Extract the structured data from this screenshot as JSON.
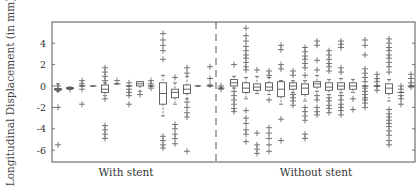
{
  "chart_data": {
    "type": "box",
    "title": "",
    "xlabel": "",
    "ylabel": "Longitudinal Displacement (in mm)",
    "ylim": [
      -7.1,
      6
    ],
    "yticks": [
      4,
      2,
      0,
      -2,
      -4,
      -6
    ],
    "grid": false,
    "legend": null,
    "groups": [
      {
        "label": "With stent",
        "center_x": 126
      },
      {
        "label": "Without stent",
        "center_x": 316
      }
    ],
    "separator": {
      "style": "dashed",
      "between_groups": [
        "With stent",
        "Without stent"
      ]
    },
    "series": [
      {
        "group": "With stent",
        "boxes": [
          {
            "x": 58,
            "q1": -0.25,
            "median": -0.3,
            "q3": -0.35,
            "wlo": -0.5,
            "whi": 0.2,
            "outliers": [
              0,
              -0.4,
              -2.0,
              -5.5
            ]
          },
          {
            "x": 70,
            "q1": -0.15,
            "median": -0.2,
            "q3": -0.25,
            "wlo": -0.3,
            "whi": -0.1,
            "outliers": [
              -0.3
            ]
          },
          {
            "x": 82,
            "q1": 0.0,
            "median": 0.0,
            "q3": 0.0,
            "wlo": 0.0,
            "whi": 0.0,
            "outliers": [
              0.5,
              0.2,
              -0.3,
              -1.7
            ]
          },
          {
            "x": 93,
            "q1": 0.0,
            "median": 0.0,
            "q3": 0.0,
            "wlo": 0.0,
            "whi": 0.0,
            "outliers": []
          },
          {
            "x": 105,
            "q1": -0.6,
            "median": -0.3,
            "q3": 0.1,
            "wlo": -0.9,
            "whi": 0.3,
            "outliers": [
              1.7,
              1.3,
              0.9,
              0.5,
              -1.2,
              -3.7,
              -4.1,
              -4.5,
              -4.9
            ]
          },
          {
            "x": 117,
            "q1": 0.2,
            "median": 0.2,
            "q3": 0.2,
            "wlo": 0.2,
            "whi": 0.2,
            "outliers": [
              0.5
            ]
          },
          {
            "x": 129,
            "q1": 0.0,
            "median": 0.0,
            "q3": 0.0,
            "wlo": 0.0,
            "whi": 0.0,
            "outliers": [
              0.3,
              -0.3,
              -0.6,
              -0.9,
              -1.7
            ]
          },
          {
            "x": 140,
            "q1": -0.0,
            "median": 0.2,
            "q3": 0.4,
            "wlo": -0.5,
            "whi": 0.4,
            "outliers": [
              -0.8
            ]
          },
          {
            "x": 151,
            "q1": 0.0,
            "median": 0.0,
            "q3": 0.0,
            "wlo": 0.0,
            "whi": 0.0,
            "outliers": [
              0.5,
              0.2,
              -0.2
            ]
          },
          {
            "x": 163,
            "q1": -1.7,
            "median": -0.7,
            "q3": 0.3,
            "wlo": -2.8,
            "whi": 1.0,
            "outliers": [
              4.9,
              4.3,
              3.8,
              3.3,
              2.5,
              -4.7,
              -5.1,
              -5.5,
              -5.8
            ]
          },
          {
            "x": 175,
            "q1": -1.1,
            "median": -0.6,
            "q3": -0.3,
            "wlo": -1.7,
            "whi": 0.3,
            "outliers": [
              0.8,
              -3.6,
              -4.0,
              -4.5,
              -4.9,
              -5.4
            ]
          },
          {
            "x": 187,
            "q1": -0.7,
            "median": -0.3,
            "q3": 0.1,
            "wlo": -1.2,
            "whi": 0.9,
            "outliers": [
              1.7,
              1.2,
              -1.5,
              -2.0,
              -2.5,
              -2.9,
              -6.1
            ]
          },
          {
            "x": 198,
            "q1": 0.0,
            "median": 0.0,
            "q3": 0.0,
            "wlo": 0.0,
            "whi": 0.0,
            "outliers": []
          },
          {
            "x": 210,
            "q1": 0.0,
            "median": 0.0,
            "q3": 0.0,
            "wlo": 0.0,
            "whi": 0.0,
            "outliers": [
              1.8,
              0.7,
              0.1
            ]
          }
        ]
      },
      {
        "group": "Without stent",
        "boxes": [
          {
            "x": 221,
            "q1": -0.2,
            "median": -0.2,
            "q3": -0.2,
            "wlo": -0.2,
            "whi": -0.2,
            "outliers": [
              0.0,
              -0.3
            ]
          },
          {
            "x": 234,
            "q1": 0.0,
            "median": 0.3,
            "q3": 0.6,
            "wlo": -0.2,
            "whi": 0.9,
            "outliers": [
              2.0,
              -0.5,
              -0.9,
              -1.3,
              -1.7,
              -2.1,
              -2.4
            ]
          },
          {
            "x": 246,
            "q1": -0.6,
            "median": -0.2,
            "q3": 0.3,
            "wlo": -1.2,
            "whi": 0.8,
            "outliers": [
              5.4,
              4.7,
              4.2,
              3.7,
              3.3,
              2.9,
              2.6,
              2.2,
              1.8,
              1.5,
              -2.3,
              -3.0,
              -3.5,
              -4.1,
              -4.5,
              -5.2
            ]
          },
          {
            "x": 257,
            "q1": -0.4,
            "median": -0.1,
            "q3": 0.2,
            "wlo": -0.7,
            "whi": 0.9,
            "outliers": [
              1.5,
              -4.4,
              -5.5,
              -5.9,
              -6.3
            ]
          },
          {
            "x": 269,
            "q1": -0.4,
            "median": -0.1,
            "q3": 0.3,
            "wlo": -0.8,
            "whi": 0.8,
            "outliers": [
              1.4,
              1.0,
              -1.3,
              -3.9,
              -4.4,
              -4.9,
              -5.5,
              -6.1
            ]
          },
          {
            "x": 281,
            "q1": -1.0,
            "median": -0.3,
            "q3": 0.4,
            "wlo": -1.7,
            "whi": 0.5,
            "outliers": [
              3.8,
              3.4,
              2.0,
              1.6,
              -3.1,
              -5.1
            ]
          },
          {
            "x": 293,
            "q1": -0.3,
            "median": 0.0,
            "q3": 0.3,
            "wlo": -0.6,
            "whi": 0.5,
            "outliers": [
              1.4,
              1.0,
              -0.8,
              -1.1,
              -1.4,
              -1.8
            ]
          },
          {
            "x": 305,
            "q1": -0.8,
            "median": -0.2,
            "q3": 0.2,
            "wlo": -1.4,
            "whi": 0.5,
            "outliers": [
              3.6,
              3.2,
              2.8,
              2.5,
              2.1,
              1.7,
              1.0,
              -2.0,
              -2.4,
              -2.8,
              -3.2,
              -4.5,
              -4.9
            ]
          },
          {
            "x": 317,
            "q1": -0.1,
            "median": 0.2,
            "q3": 0.4,
            "wlo": -0.5,
            "whi": 1.0,
            "outliers": [
              4.2,
              3.8,
              2.4,
              1.5,
              -0.9,
              -1.3,
              -2.0,
              -2.4,
              -2.7
            ]
          },
          {
            "x": 329,
            "q1": -0.4,
            "median": -0.1,
            "q3": 0.3,
            "wlo": -0.8,
            "whi": 0.6,
            "outliers": [
              3.3,
              2.9,
              2.5,
              2.1,
              1.8,
              1.4,
              -1.1,
              -1.4,
              -1.8,
              -2.1,
              -2.5
            ]
          },
          {
            "x": 341,
            "q1": -0.3,
            "median": 0.0,
            "q3": 0.3,
            "wlo": -0.6,
            "whi": 0.7,
            "outliers": [
              4.2,
              3.9,
              3.6,
              1.7,
              1.3,
              -0.9,
              -1.3,
              -1.7,
              -2.0,
              -2.3,
              -2.7
            ]
          },
          {
            "x": 353,
            "q1": -0.3,
            "median": 0.0,
            "q3": 0.3,
            "wlo": -0.6,
            "whi": 0.6,
            "outliers": [
              -1.2,
              -2.2
            ]
          },
          {
            "x": 365,
            "q1": 0.0,
            "median": 0.0,
            "q3": 0.0,
            "wlo": 0.0,
            "whi": 0.0,
            "outliers": [
              4.3,
              3.8,
              2.9,
              1.6,
              1.2,
              0.8,
              0.4,
              -0.2,
              -0.5,
              -0.8,
              -1.1,
              -1.3,
              -1.6,
              -2.0
            ]
          },
          {
            "x": 377,
            "q1": 0.0,
            "median": 0.0,
            "q3": 0.0,
            "wlo": 0.0,
            "whi": 0.0,
            "outliers": [
              1.1,
              0.7,
              0.4,
              0.0,
              -0.4
            ]
          },
          {
            "x": 389,
            "q1": -0.7,
            "median": -0.2,
            "q3": 0.2,
            "wlo": -1.4,
            "whi": 0.6,
            "outliers": [
              4.4,
              4.0,
              3.6,
              3.3,
              2.9,
              2.6,
              2.2,
              1.8,
              1.3,
              -2.2,
              -2.6,
              -2.9,
              -3.2,
              -3.5,
              -3.8,
              -4.2,
              -4.6,
              -5.1,
              -5.5
            ]
          },
          {
            "x": 401,
            "q1": -0.6,
            "median": -0.6,
            "q3": -0.6,
            "wlo": -0.6,
            "whi": -0.6,
            "outliers": [
              0.0,
              -0.3,
              -0.9,
              -1.2,
              -1.7
            ]
          },
          {
            "x": 411,
            "q1": 0.0,
            "median": 0.0,
            "q3": 0.0,
            "wlo": 0.0,
            "whi": 0.0,
            "outliers": [
              1.1,
              0.7,
              0.3,
              -0.1
            ]
          }
        ]
      }
    ]
  },
  "plot": {
    "frame": {
      "left": 52,
      "top": 22,
      "right": 415,
      "bottom": 162
    },
    "y_zero_px": 86,
    "px_per_unit": 10.7,
    "separator_x": 216,
    "colors": {
      "frame": "#555555",
      "box": "#555555",
      "outlier": "#555555",
      "text": "#333333"
    }
  },
  "labels": {
    "ylabel": "Longitudinal Displacement (in mm)",
    "group_left": "With stent",
    "group_right": "Without stent"
  }
}
